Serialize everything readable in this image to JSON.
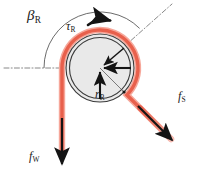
{
  "figure": {
    "background_color": "#ffffff"
  },
  "labels": {
    "wrap_angle": {
      "symbol": "β",
      "subscript": "R",
      "name": "beta-R"
    },
    "torque": {
      "symbol": "τ",
      "subscript": "R",
      "name": "tau-R"
    },
    "radius": {
      "symbol": "r",
      "subscript": "R",
      "name": "r-R"
    },
    "force_slack": {
      "symbol": "f",
      "subscript": "S",
      "name": "f-S"
    },
    "force_winch": {
      "symbol": "f",
      "subscript": "W",
      "name": "f-W"
    }
  },
  "colors": {
    "rope": "#e8604c",
    "rope_highlight": "#f6a79a",
    "drum_fill": "#e9e9e9",
    "drum_outline": "#3a3a3a",
    "arrow": "#141414",
    "datum_line": "#6a6a6a",
    "arc_line": "#3a3a3a"
  },
  "geometry": {
    "drum_center_x": 100,
    "drum_center_y": 68,
    "drum_radius_outer": 34,
    "drum_radius_inner": 31,
    "rope_radius": 38,
    "wrap_angle_degrees": 225
  },
  "elements": {
    "drum": {
      "name": "drum-disc"
    },
    "rope": {
      "name": "rope-path"
    },
    "rope_tail_down": {
      "name": "rope-tail-vertical"
    },
    "rope_tail_diagonal": {
      "name": "rope-tail-diagonal"
    },
    "torque_arrow": {
      "name": "torque-curved-arrow"
    },
    "radius_arrow_horizontal": {
      "name": "radius-arrow-horizontal"
    },
    "radius_arrow_vertical": {
      "name": "radius-arrow-vertical"
    },
    "radius_arrow_diagonal": {
      "name": "radius-arrow-diagonal"
    },
    "force_s_arrow": {
      "name": "force-s-arrow"
    },
    "force_w_arrow": {
      "name": "force-w-arrow"
    },
    "datum_horizontal": {
      "name": "datum-line-horizontal"
    },
    "datum_diagonal": {
      "name": "datum-line-diagonal"
    },
    "wrap_arc": {
      "name": "wrap-angle-arc"
    }
  }
}
